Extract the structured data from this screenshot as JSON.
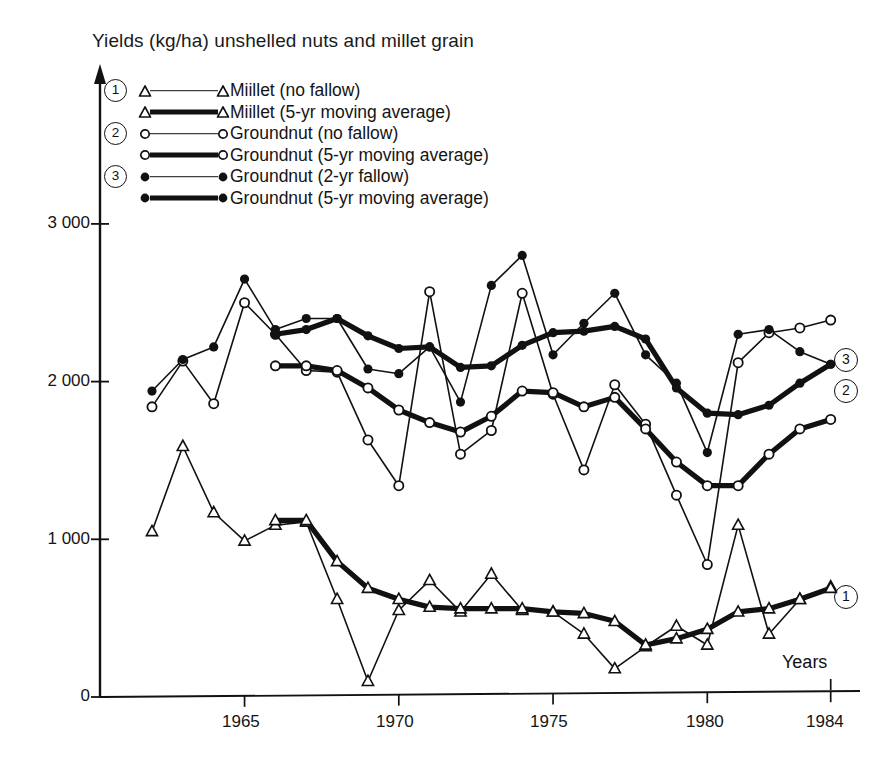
{
  "title": "Yields (kg/ha) unshelled nuts and millet grain",
  "axes": {
    "x_label": "Years",
    "y_ticks": [
      "0",
      "1 000",
      "2 000",
      "3 000"
    ],
    "x_ticks": [
      "1965",
      "1970",
      "1975",
      "1980",
      "1984"
    ]
  },
  "legend": {
    "groups": [
      "1",
      "2",
      "3"
    ],
    "entries": [
      {
        "group": "1",
        "marker": "triangle-open",
        "line": "thin",
        "label": "Miillet (no fallow)"
      },
      {
        "group": "",
        "marker": "triangle-open",
        "line": "thick",
        "label": "Miillet (5-yr moving average)"
      },
      {
        "group": "2",
        "marker": "circle-open",
        "line": "thin",
        "label": "Groundnut (no fallow)"
      },
      {
        "group": "",
        "marker": "circle-open",
        "line": "thick",
        "label": "Groundnut (5-yr moving average)"
      },
      {
        "group": "3",
        "marker": "circle-filled",
        "line": "thin",
        "label": "Groundnut (2-yr fallow)"
      },
      {
        "group": "",
        "marker": "circle-filled",
        "line": "thick",
        "label": "Groundnut (5-yr moving average)"
      }
    ]
  },
  "series_ids": {
    "millet": "1",
    "groundnut_no_fallow": "2",
    "groundnut_fallow": "3"
  },
  "chart_data": {
    "type": "line",
    "title": "Yields (kg/ha) unshelled nuts and millet grain",
    "xlabel": "Years",
    "ylabel": "Yields (kg/ha)",
    "xlim": [
      1962,
      1984
    ],
    "ylim": [
      0,
      3200
    ],
    "grid": false,
    "legend_position": "top-left",
    "x": [
      1962,
      1963,
      1964,
      1965,
      1966,
      1967,
      1968,
      1969,
      1970,
      1971,
      1972,
      1973,
      1974,
      1975,
      1976,
      1977,
      1978,
      1979,
      1980,
      1981,
      1982,
      1983,
      1984
    ],
    "series": [
      {
        "name": "Miillet (no fallow)",
        "marker": "triangle-open",
        "line": "thin",
        "values": [
          1050,
          1590,
          1170,
          990,
          1090,
          1110,
          620,
          100,
          550,
          740,
          540,
          780,
          550,
          540,
          400,
          180,
          320,
          450,
          330,
          1090,
          400,
          620,
          700
        ]
      },
      {
        "name": "Miillet (5-yr moving average)",
        "marker": "triangle-open",
        "line": "thick",
        "values": [
          null,
          null,
          null,
          null,
          1120,
          1120,
          860,
          690,
          620,
          570,
          560,
          560,
          560,
          540,
          530,
          480,
          330,
          370,
          430,
          540,
          560,
          620,
          690
        ]
      },
      {
        "name": "Groundnut (no fallow)",
        "marker": "circle-open",
        "line": "thin",
        "values": [
          1840,
          2130,
          1860,
          2500,
          2300,
          2070,
          2060,
          1630,
          1340,
          2570,
          1540,
          1690,
          2560,
          1920,
          1440,
          1980,
          1730,
          1280,
          840,
          2120,
          2310,
          2340,
          2390
        ]
      },
      {
        "name": "Groundnut (5-yr moving average)",
        "marker": "circle-open",
        "line": "thick",
        "values": [
          null,
          null,
          null,
          null,
          2100,
          2100,
          2070,
          1960,
          1820,
          1740,
          1680,
          1780,
          1940,
          1930,
          1840,
          1900,
          1700,
          1490,
          1340,
          1340,
          1540,
          1700,
          1760
        ]
      },
      {
        "name": "Groundnut (2-yr fallow)",
        "marker": "circle-filled",
        "line": "thin",
        "values": [
          1940,
          2140,
          2220,
          2650,
          2330,
          2400,
          2400,
          2080,
          2050,
          2220,
          1870,
          2610,
          2800,
          2170,
          2370,
          2560,
          2170,
          1990,
          1550,
          2300,
          2330,
          2190,
          2110
        ]
      },
      {
        "name": "Groundnut (5-yr moving average)",
        "marker": "circle-filled",
        "line": "thick",
        "values": [
          null,
          null,
          null,
          null,
          2300,
          2330,
          2400,
          2290,
          2210,
          2220,
          2090,
          2100,
          2230,
          2310,
          2320,
          2350,
          2270,
          1960,
          1800,
          1790,
          1850,
          1990,
          2110
        ]
      }
    ]
  }
}
